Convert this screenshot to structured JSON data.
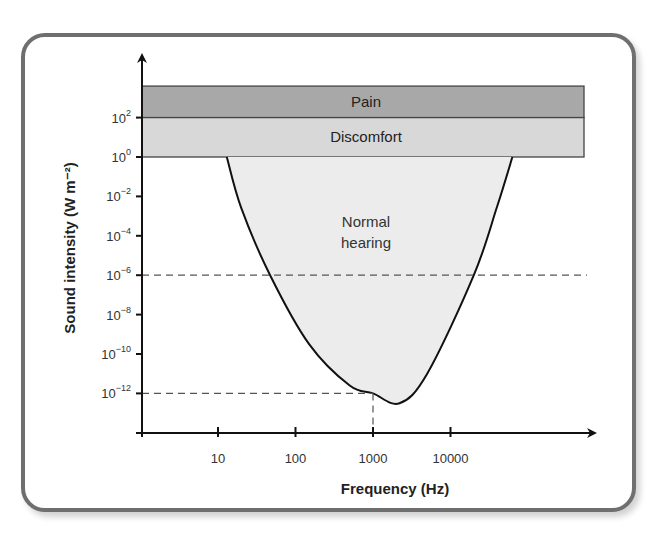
{
  "chart_data": {
    "type": "area",
    "title": "",
    "xlabel": "Frequency (Hz)",
    "ylabel": "Sound intensity (W m⁻²)",
    "xscale": "log",
    "yscale": "log",
    "x_ticks": [
      {
        "value": 10,
        "label": "10"
      },
      {
        "value": 100,
        "label": "100"
      },
      {
        "value": 1000,
        "label": "1000"
      },
      {
        "value": 10000,
        "label": "10000"
      }
    ],
    "y_ticks": [
      {
        "exp": 2,
        "base": "10",
        "sup": "2"
      },
      {
        "exp": 0,
        "base": "10",
        "sup": "0"
      },
      {
        "exp": -2,
        "base": "10",
        "sup": "−2"
      },
      {
        "exp": -4,
        "base": "10",
        "sup": "−4"
      },
      {
        "exp": -6,
        "base": "10",
        "sup": "−6"
      },
      {
        "exp": -8,
        "base": "10",
        "sup": "−8"
      },
      {
        "exp": -10,
        "base": "10",
        "sup": "−10"
      },
      {
        "exp": -12,
        "base": "10",
        "sup": "−12"
      }
    ],
    "bands": [
      {
        "name": "Pain",
        "y_from_exp": 2,
        "y_to_exp": 3.6,
        "color": "#a8a8a8"
      },
      {
        "name": "Discomfort",
        "y_from_exp": 0,
        "y_to_exp": 2,
        "color": "#d8d8d8"
      }
    ],
    "regions": [
      {
        "name": "Normal hearing",
        "label_lines": [
          "Normal",
          "hearing"
        ],
        "color": "#ececec",
        "boundary": {
          "frequency_hz": [
            13,
            20,
            47,
            150,
            500,
            1000,
            2200,
            5000,
            20000,
            40000,
            63000
          ],
          "intensity_exp": [
            0,
            -2.6,
            -6,
            -9.5,
            -11.6,
            -12,
            -12.5,
            -11,
            -6,
            -2.5,
            0
          ]
        }
      }
    ],
    "reference_lines": [
      {
        "type": "horizontal",
        "intensity_exp": -6,
        "style": "dashed"
      },
      {
        "type": "horizontal",
        "intensity_exp": -12,
        "from_x": "axis",
        "to_frequency_hz": 1000,
        "style": "dashed"
      },
      {
        "type": "vertical",
        "frequency_hz": 1000,
        "from_exp": -12,
        "to": "axis",
        "style": "dashed"
      }
    ],
    "axis_ranges": {
      "x_log10": [
        0.02,
        5.9
      ],
      "y_exp": [
        -14,
        4.5
      ]
    },
    "grid": false,
    "legend": "none"
  }
}
